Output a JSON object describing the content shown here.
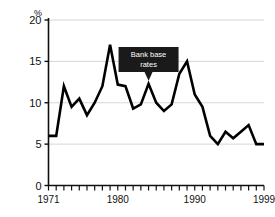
{
  "chart_data": {
    "type": "line",
    "title": "",
    "xlabel": "",
    "ylabel": "%",
    "ylim": [
      0,
      20
    ],
    "xlim": [
      1971,
      1999
    ],
    "grid": true,
    "legend_position": "none",
    "y_ticks": [
      "0",
      "5",
      "10",
      "15",
      "20"
    ],
    "y_tick_values": [
      0,
      5,
      10,
      15,
      20
    ],
    "x_tick_labels": [
      "1971",
      "1980",
      "1990",
      "1999"
    ],
    "x_tick_label_values": [
      1971,
      1980,
      1990,
      1999
    ],
    "x_all_ticks": [
      1971,
      1972,
      1973,
      1974,
      1975,
      1976,
      1977,
      1978,
      1979,
      1980,
      1981,
      1982,
      1983,
      1984,
      1985,
      1986,
      1987,
      1988,
      1989,
      1990,
      1991,
      1992,
      1993,
      1994,
      1995,
      1996,
      1997,
      1998,
      1999
    ],
    "series": [
      {
        "name": "Bank base rates",
        "x": [
          1971,
          1972,
          1973,
          1974,
          1975,
          1976,
          1977,
          1978,
          1979,
          1980,
          1981,
          1982,
          1983,
          1984,
          1985,
          1986,
          1987,
          1988,
          1989,
          1990,
          1991,
          1992,
          1993,
          1994,
          1995,
          1996,
          1997,
          1998,
          1999
        ],
        "values": [
          6.0,
          6.0,
          12.0,
          9.5,
          10.5,
          8.5,
          10.0,
          12.0,
          17.0,
          12.2,
          12.0,
          9.3,
          9.8,
          12.3,
          10.0,
          9.0,
          9.8,
          13.5,
          15.0,
          11.0,
          9.5,
          6.0,
          5.0,
          6.5,
          5.7,
          6.5,
          7.3,
          5.0,
          5.0
        ],
        "color": "#000000"
      }
    ],
    "annotations": [
      {
        "name": "bank-base-rates-callout",
        "line1": "Bank base",
        "line2": "rates",
        "target_x": 1984,
        "target_y": 12.3,
        "box_color": "#1a1a1a",
        "text_color": "#ffffff"
      }
    ],
    "colors": {
      "line": "#000000",
      "grid": "#d6d6d6",
      "axis": "#111111",
      "background": "#ffffff",
      "callout_bg": "#1a1a1a"
    }
  }
}
